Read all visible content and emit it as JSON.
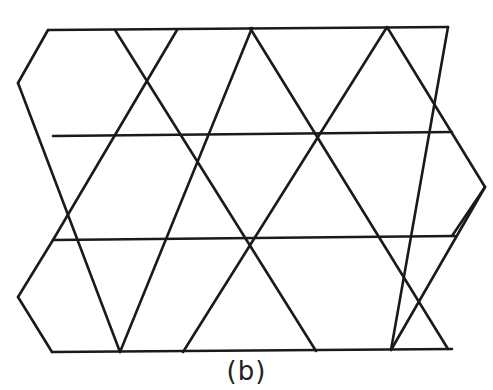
{
  "figure": {
    "caption": "(b)",
    "stroke_color": "#1a1a1a",
    "stroke_width": 2.6,
    "lines": [
      {
        "x1": 48,
        "y1": 30,
        "x2": 448,
        "y2": 27
      },
      {
        "x1": 53,
        "y1": 136,
        "x2": 452,
        "y2": 132
      },
      {
        "x1": 53,
        "y1": 240,
        "x2": 455,
        "y2": 236
      },
      {
        "x1": 52,
        "y1": 352,
        "x2": 452,
        "y2": 349
      },
      {
        "x1": 48,
        "y1": 30,
        "x2": 18,
        "y2": 83
      },
      {
        "x1": 18,
        "y1": 83,
        "x2": 120,
        "y2": 352
      },
      {
        "x1": 18,
        "y1": 297,
        "x2": 53,
        "y2": 240
      },
      {
        "x1": 18,
        "y1": 297,
        "x2": 52,
        "y2": 352
      },
      {
        "x1": 177,
        "y1": 30,
        "x2": 53,
        "y2": 240
      },
      {
        "x1": 115,
        "y1": 30,
        "x2": 316,
        "y2": 351
      },
      {
        "x1": 252,
        "y1": 28,
        "x2": 120,
        "y2": 352
      },
      {
        "x1": 250,
        "y1": 28,
        "x2": 448,
        "y2": 349
      },
      {
        "x1": 387,
        "y1": 27,
        "x2": 183,
        "y2": 352
      },
      {
        "x1": 448,
        "y1": 27,
        "x2": 391,
        "y2": 350
      },
      {
        "x1": 387,
        "y1": 27,
        "x2": 485,
        "y2": 187
      },
      {
        "x1": 485,
        "y1": 187,
        "x2": 452,
        "y2": 236
      },
      {
        "x1": 485,
        "y1": 187,
        "x2": 391,
        "y2": 350
      }
    ]
  }
}
